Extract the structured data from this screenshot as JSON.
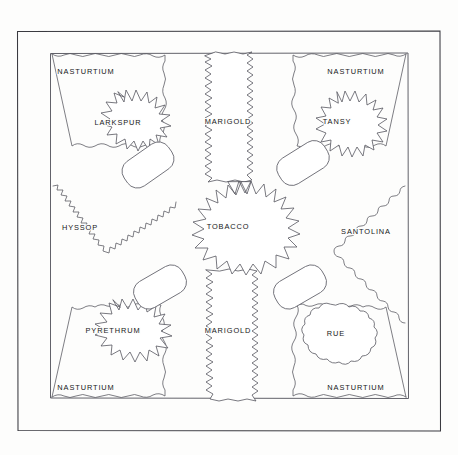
{
  "drawing": {
    "title": "Herb & Tobacco Garden Plan",
    "style": "hand-drawn line plan, ink on paper",
    "background_color": "#fdfdfc",
    "line_color": "#57575f",
    "frame": {
      "outer_rect": [
        17,
        31,
        423,
        400
      ],
      "inner_rect": [
        50,
        53,
        358,
        345
      ],
      "name": "double-ruled garden wall border"
    }
  },
  "beds": [
    {
      "id": "nasturtium-top-left",
      "label": "NASTURTIUM",
      "shape": "scalloped-corner-band",
      "label_pos": [
        86,
        71
      ]
    },
    {
      "id": "nasturtium-top-right",
      "label": "NASTURTIUM",
      "shape": "scalloped-corner-band",
      "label_pos": [
        356,
        71
      ]
    },
    {
      "id": "nasturtium-bottom-left",
      "label": "NASTURTIUM",
      "shape": "scalloped-corner-band",
      "label_pos": [
        86,
        388
      ]
    },
    {
      "id": "nasturtium-bottom-right",
      "label": "NASTURTIUM",
      "shape": "scalloped-corner-band",
      "label_pos": [
        356,
        388
      ]
    },
    {
      "id": "larkspur",
      "label": "LARKSPUR",
      "shape": "spiky-star-round",
      "label_pos": [
        118,
        122
      ]
    },
    {
      "id": "tansy",
      "label": "TANSY",
      "shape": "spiky-star-round",
      "label_pos": [
        337,
        121
      ]
    },
    {
      "id": "pyrethrum",
      "label": "PYRETHRUM",
      "shape": "spiky-star-round",
      "label_pos": [
        113,
        330
      ]
    },
    {
      "id": "rue",
      "label": "RUE",
      "shape": "scalloped-cloud-round",
      "label_pos": [
        336,
        333
      ]
    },
    {
      "id": "marigold-top",
      "label": "MARIGOLD",
      "shape": "vertical-zigzag-band",
      "label_pos": [
        228,
        121
      ]
    },
    {
      "id": "marigold-bottom",
      "label": "MARIGOLD",
      "shape": "vertical-zigzag-band",
      "label_pos": [
        228,
        330
      ]
    },
    {
      "id": "tobacco",
      "label": "TOBACCO",
      "shape": "large-spiky-star-center",
      "label_pos": [
        228,
        226
      ]
    },
    {
      "id": "hyssop",
      "label": "HYSSOP",
      "shape": "left-wedge-wavy",
      "label_pos": [
        80,
        227
      ]
    },
    {
      "id": "santolina",
      "label": "SANTOLINA",
      "shape": "right-wedge-wavy",
      "label_pos": [
        366,
        231
      ]
    }
  ],
  "planters": [
    {
      "id": "planter-top-left",
      "shape": "tilted-rounded-rectangle",
      "center": [
        148,
        165
      ],
      "rotation": -35
    },
    {
      "id": "planter-top-right",
      "shape": "tilted-rounded-rectangle",
      "center": [
        303,
        163
      ],
      "rotation": -32
    },
    {
      "id": "planter-bottom-left",
      "shape": "tilted-rounded-rectangle",
      "center": [
        160,
        287
      ],
      "rotation": -30
    },
    {
      "id": "planter-bottom-right",
      "shape": "tilted-rounded-rectangle",
      "center": [
        300,
        287
      ],
      "rotation": -30
    }
  ]
}
